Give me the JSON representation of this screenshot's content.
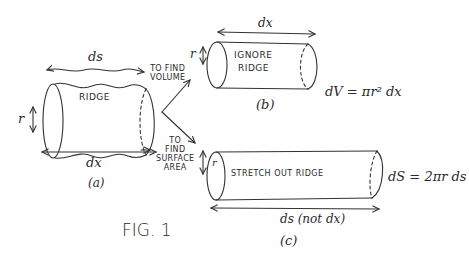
{
  "figure": {
    "caption": "FIG. 1",
    "ink_color": "#333333",
    "background": "#ffffff"
  },
  "panel_a": {
    "label": "(a)",
    "cylinder_text": "RIDGE",
    "top_dimension": "ds",
    "bottom_dimension": "dx",
    "radius_label": "r"
  },
  "branch_volume": {
    "label_line1": "TO FIND",
    "label_line2": "VOLUME"
  },
  "branch_surface": {
    "label_line1": "TO",
    "label_line2": "FIND",
    "label_line3": "SURFACE",
    "label_line4": "AREA"
  },
  "panel_b": {
    "label": "(b)",
    "cylinder_line1": "IGNORE",
    "cylinder_line2": "RIDGE",
    "top_dimension": "dx",
    "radius_label": "r",
    "formula": "dV = πr² dx"
  },
  "panel_c": {
    "label": "(c)",
    "cylinder_text": "STRETCH OUT RIDGE",
    "bottom_dimension": "ds (not dx)",
    "radius_label": "r",
    "formula": "dS = 2πr ds"
  }
}
